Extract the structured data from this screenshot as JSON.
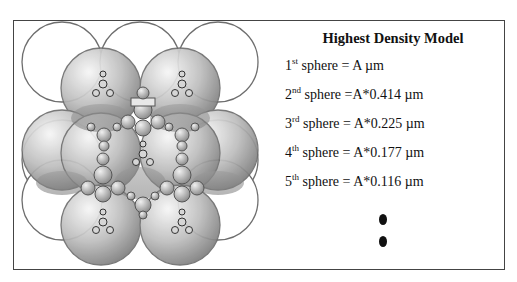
{
  "legend": {
    "title": "Highest Density Model",
    "rows": [
      {
        "num": "1",
        "suffix": "st",
        "text": " sphere = A µm"
      },
      {
        "num": "2",
        "suffix": "nd",
        "text": " sphere =A*0.414 µm"
      },
      {
        "num": "3",
        "suffix": "rd",
        "text": " sphere = A*0.225 µm"
      },
      {
        "num": "4",
        "suffix": "th",
        "text": " sphere = A*0.177 µm"
      },
      {
        "num": "5",
        "suffix": "th",
        "text": " sphere = A*0.116 µm"
      }
    ],
    "continuation": "ellipsis-dots"
  },
  "diagram": {
    "colors": {
      "outline": "#6b6b6b",
      "shade_dark": "#8a8a8a",
      "shade_light": "#f2f2f2"
    }
  }
}
